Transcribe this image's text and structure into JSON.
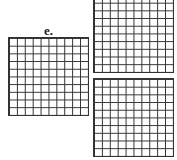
{
  "label": "e.",
  "grids": [
    {
      "name": "left-grid",
      "rows": 10,
      "cols": 10
    },
    {
      "name": "top-right-grid",
      "rows": 10,
      "cols": 10
    },
    {
      "name": "bottom-right-grid",
      "rows": 10,
      "cols": 10
    }
  ]
}
